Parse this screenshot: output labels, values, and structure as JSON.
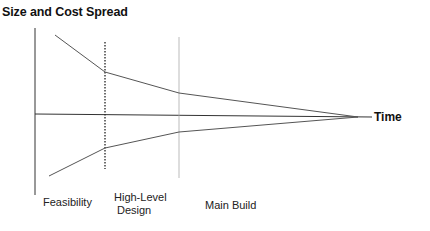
{
  "diagram": {
    "title": "Size and Cost Spread",
    "x_axis_label": "Time",
    "phases": [
      {
        "label": "Feasibility"
      },
      {
        "label_line1": "High-Level",
        "label_line2": "Design"
      },
      {
        "label": "Main Build"
      }
    ],
    "colors": {
      "lines": "#555555",
      "axes": "#333333",
      "text": "#111111"
    }
  }
}
